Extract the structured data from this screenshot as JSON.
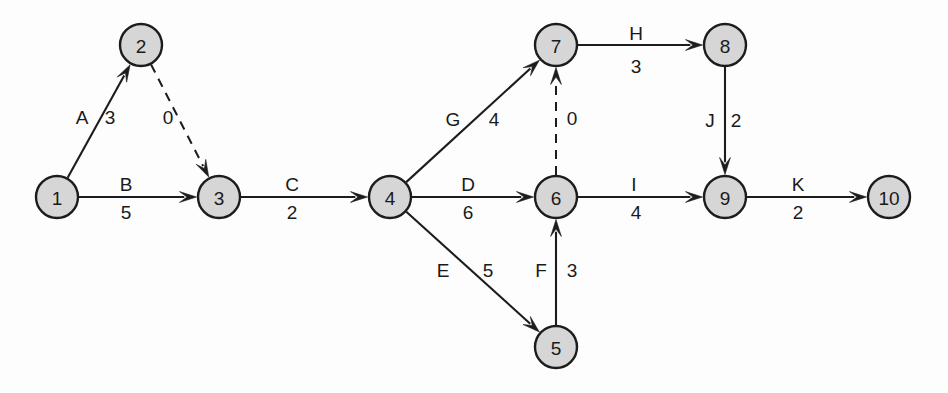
{
  "diagram": {
    "type": "activity-on-arrow-network",
    "title": "",
    "background_color": "#fdfdfd",
    "node_fill": "#d6d6d6",
    "node_stroke": "#1c1c1c",
    "nodes": [
      {
        "id": "1",
        "label": "1",
        "cx": 57,
        "cy": 197,
        "r": 21
      },
      {
        "id": "2",
        "label": "2",
        "cx": 141,
        "cy": 45,
        "r": 21
      },
      {
        "id": "3",
        "label": "3",
        "cx": 219,
        "cy": 197,
        "r": 21
      },
      {
        "id": "4",
        "label": "4",
        "cx": 390,
        "cy": 197,
        "r": 21
      },
      {
        "id": "5",
        "label": "5",
        "cx": 556,
        "cy": 347,
        "r": 21
      },
      {
        "id": "6",
        "label": "6",
        "cx": 556,
        "cy": 197,
        "r": 21
      },
      {
        "id": "7",
        "label": "7",
        "cx": 556,
        "cy": 45,
        "r": 21
      },
      {
        "id": "8",
        "label": "8",
        "cx": 725,
        "cy": 45,
        "r": 21
      },
      {
        "id": "9",
        "label": "9",
        "cx": 725,
        "cy": 197,
        "r": 21
      },
      {
        "id": "10",
        "label": "10",
        "cx": 889,
        "cy": 197,
        "r": 21
      }
    ],
    "edges": [
      {
        "id": "A",
        "from": "1",
        "to": "2",
        "activity": "A",
        "duration": "3",
        "style": "solid",
        "activity_x": 82,
        "activity_y": 117,
        "duration_x": 110,
        "duration_y": 117
      },
      {
        "id": "dummy-2-3",
        "from": "2",
        "to": "3",
        "activity": "",
        "duration": "0",
        "style": "dashed",
        "activity_x": 0,
        "activity_y": 0,
        "duration_x": 168,
        "duration_y": 117
      },
      {
        "id": "B",
        "from": "1",
        "to": "3",
        "activity": "B",
        "duration": "5",
        "style": "solid",
        "activity_x": 126,
        "activity_y": 184,
        "duration_x": 126,
        "duration_y": 212
      },
      {
        "id": "C",
        "from": "3",
        "to": "4",
        "activity": "C",
        "duration": "2",
        "style": "solid",
        "activity_x": 292,
        "activity_y": 184,
        "duration_x": 292,
        "duration_y": 212
      },
      {
        "id": "G",
        "from": "4",
        "to": "7",
        "activity": "G",
        "duration": "4",
        "style": "solid",
        "activity_x": 453,
        "activity_y": 119,
        "duration_x": 494,
        "duration_y": 119
      },
      {
        "id": "D",
        "from": "4",
        "to": "6",
        "activity": "D",
        "duration": "6",
        "style": "solid",
        "activity_x": 468,
        "activity_y": 184,
        "duration_x": 468,
        "duration_y": 212
      },
      {
        "id": "E",
        "from": "4",
        "to": "5",
        "activity": "E",
        "duration": "5",
        "style": "solid",
        "activity_x": 443,
        "activity_y": 270,
        "duration_x": 488,
        "duration_y": 270
      },
      {
        "id": "F",
        "from": "5",
        "to": "6",
        "activity": "F",
        "duration": "3",
        "style": "solid",
        "activity_x": 541,
        "activity_y": 270,
        "duration_x": 572,
        "duration_y": 270
      },
      {
        "id": "dummy-6-7",
        "from": "6",
        "to": "7",
        "activity": "",
        "duration": "0",
        "style": "dashed",
        "activity_x": 0,
        "activity_y": 0,
        "duration_x": 572,
        "duration_y": 118
      },
      {
        "id": "H",
        "from": "7",
        "to": "8",
        "activity": "H",
        "duration": "3",
        "style": "solid",
        "activity_x": 636,
        "activity_y": 33,
        "duration_x": 636,
        "duration_y": 66
      },
      {
        "id": "I",
        "from": "6",
        "to": "9",
        "activity": "I",
        "duration": "4",
        "style": "solid",
        "activity_x": 634,
        "activity_y": 184,
        "duration_x": 636,
        "duration_y": 212
      },
      {
        "id": "J",
        "from": "8",
        "to": "9",
        "activity": "J",
        "duration": "2",
        "style": "solid",
        "activity_x": 710,
        "activity_y": 120,
        "duration_x": 736,
        "duration_y": 120
      },
      {
        "id": "K",
        "from": "9",
        "to": "10",
        "activity": "K",
        "duration": "2",
        "style": "solid",
        "activity_x": 798,
        "activity_y": 184,
        "duration_x": 798,
        "duration_y": 212
      }
    ]
  }
}
